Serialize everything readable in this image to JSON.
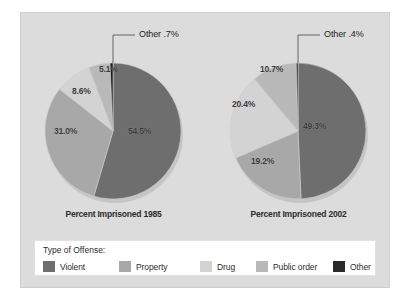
{
  "figure": {
    "background": "#ffffff",
    "panel_color": "#dcdcdc"
  },
  "legend": {
    "title": "Type of Offense:",
    "items": [
      {
        "label": "Violent",
        "color": "#6e6e6e",
        "left": 0
      },
      {
        "label": "Property",
        "color": "#a8a8a8",
        "left": 76
      },
      {
        "label": "Drug",
        "color": "#d3d3d3",
        "left": 157
      },
      {
        "label": "Public order",
        "color": "#b9b9b9",
        "left": 213
      },
      {
        "label": "Other",
        "color": "#2a2a2a",
        "left": 290
      }
    ]
  },
  "chart_data": [
    {
      "type": "pie",
      "title": "Percent Imprisoned 1985",
      "categories": [
        "Violent",
        "Property",
        "Drug",
        "Public order",
        "Other"
      ],
      "values": [
        54.5,
        31.0,
        8.6,
        5.1,
        0.7
      ],
      "labels": [
        "54.5%",
        "31.0%",
        "8.6%",
        "5.1%",
        "Other .7%"
      ],
      "colors": [
        "#6e6e6e",
        "#a8a8a8",
        "#d3d3d3",
        "#b9b9b9",
        "#1a1a1a"
      ],
      "start_angle_deg": 0,
      "direction": "clockwise",
      "callout": {
        "label": "Other .7%",
        "series": "Other"
      },
      "label_positions": [
        {
          "text": "54.5%",
          "left": 107,
          "top": 113
        },
        {
          "text": "31.0%",
          "left": 33,
          "top": 113
        },
        {
          "text": "8.6%",
          "left": 51,
          "top": 73
        },
        {
          "text": "5.1%",
          "left": 78,
          "top": 51
        }
      ]
    },
    {
      "type": "pie",
      "title": "Percent Imprisoned 2002",
      "categories": [
        "Violent",
        "Property",
        "Drug",
        "Public order",
        "Other"
      ],
      "values": [
        49.3,
        19.2,
        20.4,
        10.7,
        0.4
      ],
      "labels": [
        "49.3%",
        "19.2%",
        "20.4%",
        "10.7%",
        "Other .4%"
      ],
      "colors": [
        "#6e6e6e",
        "#a8a8a8",
        "#d3d3d3",
        "#b9b9b9",
        "#1a1a1a"
      ],
      "start_angle_deg": 0,
      "direction": "clockwise",
      "callout": {
        "label": "Other .4%",
        "series": "Other"
      },
      "label_positions": [
        {
          "text": "49.3%",
          "left": 97,
          "top": 108
        },
        {
          "text": "19.2%",
          "left": 45,
          "top": 143
        },
        {
          "text": "20.4%",
          "left": 26,
          "top": 86
        },
        {
          "text": "10.7%",
          "left": 54,
          "top": 51
        }
      ]
    }
  ]
}
